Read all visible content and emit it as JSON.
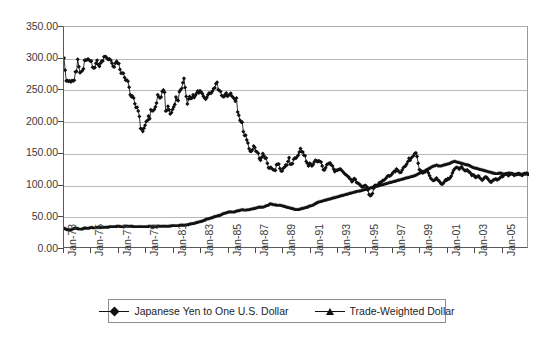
{
  "chart_data": {
    "type": "line",
    "title": "",
    "subtitle": "",
    "xlabel": "",
    "ylabel": "",
    "ylim": [
      0,
      350
    ],
    "yticks": [
      "0.00",
      "50.00",
      "100.00",
      "150.00",
      "200.00",
      "250.00",
      "300.00",
      "350.00"
    ],
    "ytick_values": [
      0,
      50,
      100,
      150,
      200,
      250,
      300,
      350
    ],
    "grid": true,
    "legend_position": "bottom-center",
    "x_tick_labels": [
      "Jan-73",
      "Jan-75",
      "Jan-77",
      "Jan-79",
      "Jan-81",
      "Jan-83",
      "Jan-85",
      "Jan-87",
      "Jan-89",
      "Jan-91",
      "Jan-93",
      "Jan-95",
      "Jan-97",
      "Jan-99",
      "Jan-01",
      "Jan-03",
      "Jan-05"
    ],
    "x_tick_step_years": 2,
    "x_range": [
      "Jan-73",
      "Dec-06"
    ],
    "marker_shapes": [
      "diamond",
      "triangle"
    ],
    "series_color": "#111111",
    "series": [
      {
        "name": "Japanese Yen to One U.S. Dollar",
        "marker": "diamond",
        "values": [
          301.0,
          282.0,
          265.0,
          265.5,
          264.5,
          265.0,
          263.5,
          265.5,
          265.0,
          266.0,
          279.5,
          280.0,
          299.0,
          287.5,
          278.0,
          279.5,
          281.0,
          284.0,
          297.5,
          298.0,
          298.0,
          299.5,
          298.0,
          296.0,
          296.5,
          286.5,
          285.5,
          286.0,
          293.0,
          297.5,
          290.5,
          288.0,
          293.0,
          296.5,
          296.5,
          303.0,
          303.5,
          302.5,
          299.5,
          299.0,
          299.5,
          297.5,
          293.0,
          288.0,
          287.0,
          293.0,
          296.0,
          293.0,
          292.5,
          283.0,
          277.0,
          277.5,
          277.0,
          270.5,
          266.0,
          266.5,
          264.5,
          255.0,
          243.0,
          240.0,
          241.0,
          238.0,
          229.0,
          223.0,
          223.5,
          217.5,
          209.0,
          190.0,
          189.0,
          185.5,
          190.5,
          195.0,
          201.0,
          202.5,
          209.5,
          205.5,
          219.5,
          218.0,
          218.0,
          220.0,
          224.0,
          230.0,
          243.0,
          240.0,
          238.0,
          239.5,
          248.5,
          250.5,
          247.0,
          217.5,
          218.5,
          225.0,
          219.5,
          213.0,
          215.0,
          220.0,
          224.0,
          228.0,
          239.5,
          235.0,
          234.0,
          248.0,
          251.0,
          253.0,
          262.0,
          269.0,
          254.5,
          240.5,
          228.5,
          236.5,
          240.5,
          237.5,
          238.0,
          243.0,
          239.0,
          242.0,
          245.5,
          249.0,
          246.0,
          249.5,
          248.0,
          245.0,
          241.0,
          238.0,
          236.0,
          239.0,
          243.0,
          246.0,
          245.5,
          246.0,
          249.0,
          253.0,
          254.0,
          260.5,
          263.0,
          251.0,
          250.0,
          248.5,
          242.0,
          240.5,
          240.0,
          243.5,
          246.0,
          241.0,
          242.0,
          244.0,
          245.5,
          241.0,
          239.0,
          237.0,
          233.0,
          238.0,
          216.0,
          211.0,
          203.0,
          200.5,
          200.0,
          185.0,
          179.0,
          179.5,
          172.0,
          167.0,
          158.0,
          154.0,
          154.0,
          156.5,
          162.5,
          160.0,
          154.0,
          153.0,
          151.0,
          142.5,
          140.0,
          144.5,
          150.5,
          147.0,
          143.0,
          143.5,
          135.0,
          128.0,
          127.5,
          129.0,
          127.0,
          125.0,
          124.5,
          124.0,
          133.0,
          133.5,
          134.0,
          127.0,
          123.0,
          123.0,
          127.5,
          129.0,
          132.5,
          132.0,
          138.0,
          144.0,
          133.5,
          134.0,
          134.5,
          141.5,
          143.5,
          143.0,
          145.5,
          148.0,
          153.0,
          158.5,
          153.5,
          153.0,
          148.0,
          147.0,
          138.0,
          135.0,
          131.0,
          135.0,
          134.0,
          131.0,
          133.0,
          137.0,
          140.0,
          139.0,
          137.5,
          139.0,
          138.0,
          137.0,
          131.0,
          125.0,
          124.5,
          128.0,
          133.0,
          134.0,
          135.0,
          135.5,
          132.5,
          131.0,
          126.0,
          122.0,
          124.0,
          124.0,
          125.0,
          125.5,
          126.0,
          124.0,
          122.0,
          120.0,
          118.0,
          117.0,
          115.0,
          114.0,
          111.0,
          110.0,
          106.0,
          108.0,
          111.0,
          110.0,
          105.0,
          104.0,
          103.0,
          101.5,
          99.0,
          98.0,
          99.0,
          99.5,
          100.0,
          98.0,
          93.0,
          86.0,
          84.0,
          85.0,
          87.5,
          95.5,
          100.0,
          100.5,
          100.0,
          101.5,
          104.5,
          105.0,
          106.0,
          108.0,
          108.5,
          110.0,
          112.0,
          114.5,
          115.5,
          115.0,
          116.0,
          118.0,
          120.5,
          122.5,
          122.0,
          126.0,
          124.5,
          122.0,
          120.5,
          121.0,
          124.5,
          128.0,
          130.0,
          131.0,
          134.0,
          138.0,
          143.0,
          140.0,
          143.5,
          145.5,
          147.0,
          150.5,
          151.5,
          146.0,
          135.0,
          125.0,
          124.0,
          121.0,
          120.0,
          121.0,
          121.5,
          123.5,
          124.0,
          120.0,
          115.5,
          111.5,
          109.5,
          108.0,
          108.5,
          109.5,
          112.0,
          109.0,
          108.0,
          105.5,
          103.0,
          102.0,
          103.5,
          106.5,
          109.0,
          108.5,
          111.0,
          110.5,
          112.5,
          115.0,
          120.0,
          124.0,
          126.5,
          128.0,
          129.0,
          127.5,
          126.0,
          128.5,
          129.5,
          127.0,
          125.0,
          123.5,
          124.0,
          124.5,
          122.0,
          121.5,
          119.0,
          116.0,
          117.0,
          116.0,
          113.0,
          113.5,
          114.5,
          115.0,
          112.0,
          110.5,
          108.5,
          110.0,
          112.5,
          113.5,
          113.0,
          110.5,
          108.5,
          106.0,
          105.5,
          107.5,
          109.0,
          109.5,
          110.5,
          109.0,
          110.0,
          111.0,
          113.0,
          114.5,
          114.0,
          116.5,
          118.0,
          118.5,
          117.0,
          115.5,
          117.0,
          118.5,
          119.0,
          118.0,
          116.0,
          117.0,
          117.5,
          118.0,
          118.5,
          117.5,
          117.0,
          116.0,
          118.0,
          119.0,
          118.5,
          119.5,
          118.5,
          117.5
        ]
      },
      {
        "name": "Trade-Weighted Dollar",
        "marker": "triangle",
        "values": [
          33.5,
          32.5,
          31.5,
          31.0,
          30.5,
          30.0,
          30.5,
          31.5,
          32.5,
          33.0,
          33.5,
          33.0,
          32.5,
          32.0,
          31.5,
          31.5,
          32.0,
          33.0,
          33.5,
          33.5,
          33.0,
          33.0,
          33.5,
          34.0,
          34.0,
          34.0,
          33.5,
          33.5,
          34.0,
          34.5,
          34.5,
          34.5,
          34.0,
          34.0,
          34.5,
          34.5,
          34.5,
          34.5,
          34.5,
          35.0,
          35.5,
          35.5,
          35.5,
          35.5,
          35.5,
          35.5,
          36.0,
          36.0,
          36.0,
          36.0,
          35.5,
          35.5,
          35.5,
          36.0,
          36.5,
          36.5,
          36.0,
          36.0,
          36.0,
          36.0,
          36.0,
          35.5,
          35.5,
          35.5,
          35.5,
          35.5,
          35.5,
          35.5,
          35.5,
          35.5,
          35.5,
          35.5,
          35.5,
          35.5,
          36.0,
          36.0,
          36.0,
          36.0,
          35.5,
          35.5,
          35.5,
          36.0,
          36.5,
          36.5,
          36.0,
          36.0,
          36.0,
          36.0,
          36.0,
          36.0,
          36.0,
          36.0,
          36.5,
          36.5,
          37.0,
          37.0,
          37.0,
          37.0,
          37.0,
          37.0,
          37.0,
          37.5,
          37.5,
          38.0,
          38.0,
          38.0,
          38.0,
          38.5,
          38.5,
          39.0,
          39.5,
          40.0,
          40.5,
          40.5,
          41.0,
          41.5,
          42.0,
          42.5,
          43.0,
          43.5,
          44.0,
          44.5,
          45.0,
          46.0,
          47.0,
          47.5,
          48.0,
          48.5,
          49.0,
          49.5,
          50.0,
          51.0,
          51.5,
          52.0,
          52.5,
          53.0,
          53.5,
          54.0,
          55.0,
          56.0,
          56.5,
          57.0,
          57.5,
          58.0,
          58.5,
          59.0,
          59.0,
          58.5,
          58.5,
          59.0,
          59.5,
          60.0,
          60.5,
          61.0,
          61.5,
          62.0,
          62.0,
          62.0,
          61.5,
          61.5,
          62.0,
          62.0,
          62.5,
          63.0,
          63.0,
          63.5,
          64.0,
          64.5,
          65.0,
          65.5,
          66.0,
          66.5,
          66.5,
          66.0,
          66.5,
          67.0,
          68.0,
          68.5,
          69.0,
          70.0,
          71.0,
          71.5,
          71.0,
          70.5,
          70.0,
          70.0,
          69.5,
          69.0,
          69.0,
          69.5,
          69.0,
          68.5,
          68.0,
          67.5,
          67.0,
          66.5,
          66.0,
          65.5,
          65.0,
          64.5,
          64.0,
          63.5,
          63.0,
          62.5,
          62.5,
          62.5,
          63.0,
          63.5,
          64.0,
          64.5,
          65.0,
          65.5,
          66.0,
          66.5,
          67.5,
          68.0,
          68.5,
          69.0,
          70.0,
          71.0,
          72.0,
          73.0,
          74.0,
          74.5,
          75.0,
          75.5,
          76.0,
          76.5,
          77.0,
          77.5,
          78.0,
          78.5,
          79.0,
          79.5,
          80.0,
          80.5,
          81.0,
          81.5,
          82.0,
          82.5,
          83.0,
          83.5,
          84.0,
          84.5,
          85.0,
          85.5,
          86.0,
          86.5,
          87.0,
          87.5,
          88.0,
          88.5,
          89.0,
          89.5,
          90.0,
          90.5,
          91.0,
          91.0,
          91.5,
          92.0,
          92.5,
          93.0,
          93.5,
          94.0,
          94.5,
          95.0,
          95.5,
          96.0,
          96.5,
          97.0,
          97.5,
          98.0,
          98.5,
          99.0,
          99.5,
          100.0,
          100.5,
          101.0,
          101.5,
          102.0,
          102.5,
          103.0,
          103.5,
          104.0,
          104.5,
          105.0,
          105.5,
          106.0,
          106.5,
          107.0,
          107.5,
          108.0,
          108.5,
          109.0,
          109.5,
          110.0,
          110.5,
          111.0,
          111.5,
          112.0,
          112.5,
          113.0,
          113.5,
          114.0,
          114.5,
          115.0,
          115.5,
          116.0,
          117.0,
          118.0,
          119.0,
          120.0,
          121.0,
          122.0,
          122.5,
          123.0,
          124.0,
          125.0,
          126.0,
          127.0,
          128.0,
          129.0,
          130.0,
          131.0,
          131.5,
          132.0,
          132.5,
          132.0,
          131.5,
          131.0,
          131.5,
          132.0,
          132.5,
          133.0,
          133.5,
          134.0,
          134.5,
          135.0,
          136.0,
          137.0,
          137.5,
          138.0,
          138.5,
          138.0,
          137.5,
          137.0,
          136.5,
          136.0,
          135.5,
          135.0,
          134.5,
          134.0,
          133.5,
          133.0,
          132.5,
          132.0,
          131.0,
          130.0,
          129.0,
          128.5,
          128.0,
          127.5,
          127.0,
          126.5,
          126.0,
          125.5,
          125.0,
          124.5,
          124.0,
          123.5,
          123.0,
          122.5,
          122.0,
          121.5,
          121.0,
          120.5,
          120.0,
          119.5,
          119.0,
          119.0,
          119.5,
          120.0,
          120.0,
          119.5,
          119.0,
          118.5,
          118.5,
          119.0,
          119.5,
          120.0,
          120.0,
          119.5,
          119.0,
          118.5,
          118.0,
          118.0,
          118.5,
          119.0,
          119.5,
          119.0,
          118.5,
          118.0,
          118.5,
          119.0,
          119.5,
          119.0,
          118.5,
          118.0
        ]
      }
    ]
  },
  "legend": {
    "entries": [
      {
        "label": "Japanese Yen to One U.S. Dollar",
        "marker": "diamond"
      },
      {
        "label": "Trade-Weighted Dollar",
        "marker": "triangle"
      }
    ]
  }
}
